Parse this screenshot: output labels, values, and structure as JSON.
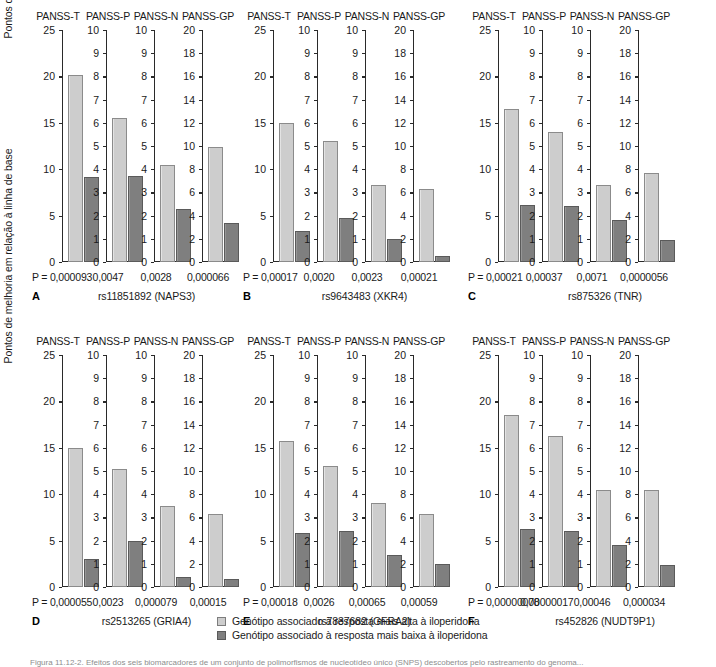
{
  "figure": {
    "ylabel": "Pontos de melhoria em relação à linha de base",
    "p_prefix": "P = ",
    "caption": "Figura 11.12-2. Efeitos dos seis biomarcadores de um conjunto de polimorfismos de nucleotídeo único (SNPS) descobertos pelo rastreamento do genoma..."
  },
  "legend": {
    "items": [
      {
        "key": "hi",
        "label": "Genótipo associado à resposta mais alta à iloperidona",
        "color": "#cdcdcd"
      },
      {
        "key": "lo",
        "label": "Genótipo associado à resposta mais baixa à iloperidona",
        "color": "#7f7f7f"
      }
    ]
  },
  "chart_data": {
    "type": "bar",
    "title": "",
    "ylabel": "Pontos de melhoria em relação à linha de base",
    "xlabel": "",
    "grid": false,
    "legend_position": "bottom-center",
    "series": [
      {
        "name": "Genótipo associado à resposta mais alta à iloperidona",
        "color": "#cdcdcd"
      },
      {
        "name": "Genótipo associado à resposta mais baixa à iloperidona",
        "color": "#7f7f7f"
      }
    ],
    "panels": [
      {
        "letter": "A",
        "snp": "rs11851892 (NAPS3)",
        "subplots": [
          {
            "title": "PANSS-T",
            "ylim": [
              0,
              25
            ],
            "yticks": [
              0,
              5,
              10,
              15,
              20,
              25
            ],
            "p": "0,000093",
            "values": [
              20.1,
              9.2
            ]
          },
          {
            "title": "PANSS-P",
            "ylim": [
              0,
              10
            ],
            "yticks": [
              0,
              1,
              2,
              3,
              4,
              5,
              6,
              7,
              8,
              9,
              10
            ],
            "p": "0,0047",
            "values": [
              6.2,
              3.7
            ]
          },
          {
            "title": "PANSS-N",
            "ylim": [
              0,
              10
            ],
            "yticks": [
              0,
              1,
              2,
              3,
              4,
              5,
              6,
              7,
              8,
              9,
              10
            ],
            "p": "0,0028",
            "values": [
              4.2,
              2.3
            ]
          },
          {
            "title": "PANSS-GP",
            "ylim": [
              0,
              20
            ],
            "yticks": [
              0,
              2,
              4,
              6,
              8,
              10,
              12,
              14,
              16,
              18,
              20
            ],
            "p": "0,000066",
            "values": [
              9.9,
              3.4
            ]
          }
        ]
      },
      {
        "letter": "B",
        "snp": "rs9643483 (XKR4)",
        "subplots": [
          {
            "title": "PANSS-T",
            "ylim": [
              0,
              25
            ],
            "yticks": [
              0,
              5,
              10,
              15,
              20,
              25
            ],
            "p": "0,00017",
            "values": [
              15.0,
              3.3
            ]
          },
          {
            "title": "PANSS-P",
            "ylim": [
              0,
              10
            ],
            "yticks": [
              0,
              1,
              2,
              3,
              4,
              5,
              6,
              7,
              8,
              9,
              10
            ],
            "p": "0,0020",
            "values": [
              5.2,
              1.9
            ]
          },
          {
            "title": "PANSS-N",
            "ylim": [
              0,
              10
            ],
            "yticks": [
              0,
              1,
              2,
              3,
              4,
              5,
              6,
              7,
              8,
              9,
              10
            ],
            "p": "0,0023",
            "values": [
              3.3,
              1.0
            ]
          },
          {
            "title": "PANSS-GP",
            "ylim": [
              0,
              20
            ],
            "yticks": [
              0,
              2,
              4,
              6,
              8,
              10,
              12,
              14,
              16,
              18,
              20
            ],
            "p": "0,00021",
            "values": [
              6.3,
              0.5
            ]
          }
        ]
      },
      {
        "letter": "C",
        "snp": "rs875326 (TNR)",
        "subplots": [
          {
            "title": "PANSS-T",
            "ylim": [
              0,
              25
            ],
            "yticks": [
              0,
              5,
              10,
              15,
              20,
              25
            ],
            "p": "0,00021",
            "values": [
              16.5,
              6.1
            ]
          },
          {
            "title": "PANSS-P",
            "ylim": [
              0,
              10
            ],
            "yticks": [
              0,
              1,
              2,
              3,
              4,
              5,
              6,
              7,
              8,
              9,
              10
            ],
            "p": "0,00037",
            "values": [
              5.6,
              2.4
            ]
          },
          {
            "title": "PANSS-N",
            "ylim": [
              0,
              10
            ],
            "yticks": [
              0,
              1,
              2,
              3,
              4,
              5,
              6,
              7,
              8,
              9,
              10
            ],
            "p": "0,0071",
            "values": [
              3.3,
              1.8
            ]
          },
          {
            "title": "PANSS-GP",
            "ylim": [
              0,
              20
            ],
            "yticks": [
              0,
              2,
              4,
              6,
              8,
              10,
              12,
              14,
              16,
              18,
              20
            ],
            "p": "0,0000056",
            "values": [
              7.7,
              1.9
            ]
          }
        ]
      },
      {
        "letter": "D",
        "snp": "rs2513265 (GRIA4)",
        "subplots": [
          {
            "title": "PANSS-T",
            "ylim": [
              0,
              25
            ],
            "yticks": [
              0,
              5,
              10,
              15,
              20,
              25
            ],
            "p": "0,000055",
            "values": [
              15.0,
              3.0
            ]
          },
          {
            "title": "PANSS-P",
            "ylim": [
              0,
              10
            ],
            "yticks": [
              0,
              1,
              2,
              3,
              4,
              5,
              6,
              7,
              8,
              9,
              10
            ],
            "p": "0,0023",
            "values": [
              5.1,
              2.0
            ]
          },
          {
            "title": "PANSS-N",
            "ylim": [
              0,
              10
            ],
            "yticks": [
              0,
              1,
              2,
              3,
              4,
              5,
              6,
              7,
              8,
              9,
              10
            ],
            "p": "0,000079",
            "values": [
              3.5,
              0.45
            ]
          },
          {
            "title": "PANSS-GP",
            "ylim": [
              0,
              20
            ],
            "yticks": [
              0,
              2,
              4,
              6,
              8,
              10,
              12,
              14,
              16,
              18,
              20
            ],
            "p": "0,00015",
            "values": [
              6.3,
              0.7
            ]
          }
        ]
      },
      {
        "letter": "E",
        "snp": "rs7837682 (GFRA2)",
        "subplots": [
          {
            "title": "PANSS-T",
            "ylim": [
              0,
              25
            ],
            "yticks": [
              0,
              5,
              10,
              15,
              20,
              25
            ],
            "p": "0,00018",
            "values": [
              15.7,
              5.8
            ]
          },
          {
            "title": "PANSS-P",
            "ylim": [
              0,
              10
            ],
            "yticks": [
              0,
              1,
              2,
              3,
              4,
              5,
              6,
              7,
              8,
              9,
              10
            ],
            "p": "0,0026",
            "values": [
              5.2,
              2.4
            ]
          },
          {
            "title": "PANSS-N",
            "ylim": [
              0,
              10
            ],
            "yticks": [
              0,
              1,
              2,
              3,
              4,
              5,
              6,
              7,
              8,
              9,
              10
            ],
            "p": "0,00065",
            "values": [
              3.6,
              1.4
            ]
          },
          {
            "title": "PANSS-GP",
            "ylim": [
              0,
              20
            ],
            "yticks": [
              0,
              2,
              4,
              6,
              8,
              10,
              12,
              14,
              16,
              18,
              20
            ],
            "p": "0,00059",
            "values": [
              6.3,
              2.0
            ]
          }
        ]
      },
      {
        "letter": "F",
        "snp": "rs452826 (NUDT9P1)",
        "subplots": [
          {
            "title": "PANSS-T",
            "ylim": [
              0,
              25
            ],
            "yticks": [
              0,
              5,
              10,
              15,
              20,
              25
            ],
            "p": "0,00000078",
            "values": [
              18.5,
              6.2
            ]
          },
          {
            "title": "PANSS-P",
            "ylim": [
              0,
              10
            ],
            "yticks": [
              0,
              1,
              2,
              3,
              4,
              5,
              6,
              7,
              8,
              9,
              10
            ],
            "p": "0,00000017",
            "values": [
              6.5,
              2.4
            ]
          },
          {
            "title": "PANSS-N",
            "ylim": [
              0,
              10
            ],
            "yticks": [
              0,
              1,
              2,
              3,
              4,
              5,
              6,
              7,
              8,
              9,
              10
            ],
            "p": "0,00046",
            "values": [
              4.2,
              1.8
            ]
          },
          {
            "title": "PANSS-GP",
            "ylim": [
              0,
              20
            ],
            "yticks": [
              0,
              2,
              4,
              6,
              8,
              10,
              12,
              14,
              16,
              18,
              20
            ],
            "p": "0,000034",
            "values": [
              8.4,
              1.9
            ]
          }
        ]
      }
    ]
  }
}
